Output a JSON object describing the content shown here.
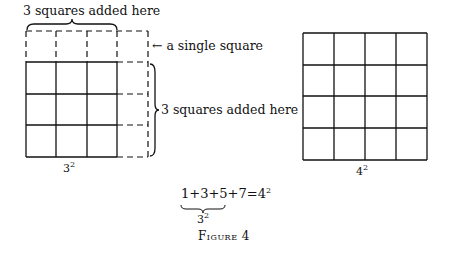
{
  "figure": {
    "caption": "Figure 4",
    "left_diagram": {
      "top_label": "3 squares added here",
      "corner_label": "← a single square",
      "side_label": "3 squares added here",
      "base": "3",
      "exponent": "2",
      "solid_grid_size": 3,
      "dashed_extension": "one row on top and one column on right"
    },
    "right_diagram": {
      "base": "4",
      "exponent": "2",
      "grid_size": 4
    },
    "equation": {
      "terms": "1+3+5+7=4",
      "exponent": "2",
      "underbrace_label_base": "3",
      "underbrace_label_exponent": "2",
      "underbrace_span": "1+3+5"
    }
  }
}
